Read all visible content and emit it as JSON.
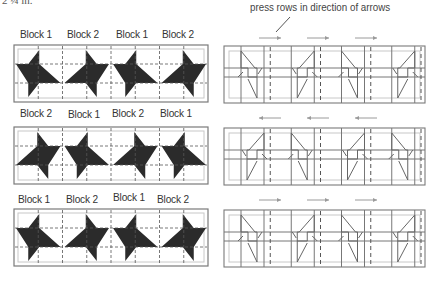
{
  "top_cut_text": "2 ¼ in.",
  "caption": "press rows in direction of arrows",
  "colors": {
    "star_fill": "#2b2b2b",
    "outline": "#7a7a7a",
    "inner_border": "#c8c8c8",
    "dashed": "#555555",
    "pressing_line": "#777777",
    "arrow": "#9a9a9a"
  },
  "rows": [
    {
      "block_labels": [
        "Block 1",
        "Block 2",
        "Block 1",
        "Block 2"
      ],
      "block_types": [
        1,
        2,
        1,
        2
      ],
      "press_direction": "right"
    },
    {
      "block_labels": [
        "Block 2",
        "Block 1",
        "Block 2",
        "Block 1"
      ],
      "block_types": [
        2,
        1,
        2,
        1
      ],
      "press_direction": "left"
    },
    {
      "block_labels": [
        "Block 1",
        "Block 2",
        "Block 1",
        "Block 2"
      ],
      "block_types": [
        1,
        2,
        1,
        2
      ],
      "press_direction": "right"
    }
  ],
  "arrows_per_row": 3
}
